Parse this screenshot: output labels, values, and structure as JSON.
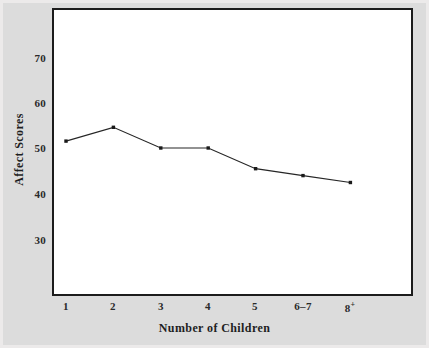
{
  "chart_data": {
    "type": "line",
    "title": "",
    "xlabel": "Number of Children",
    "ylabel": "Affect Scores",
    "categories": [
      "1",
      "2",
      "3",
      "4",
      "5",
      "6–7",
      "8⁺"
    ],
    "values": [
      51.5,
      54.5,
      50,
      50,
      45.5,
      44,
      42.5
    ],
    "series": [
      {
        "name": "Affect Scores",
        "values": [
          51.5,
          54.5,
          50,
          50,
          45.5,
          44,
          42.5
        ]
      }
    ],
    "ylim": [
      24,
      76
    ],
    "yticks": [
      30,
      40,
      50,
      60,
      70
    ],
    "ytick_labels": [
      "30",
      "40",
      "50",
      "60",
      "70"
    ],
    "grid": false,
    "legend": false,
    "marker": "square",
    "line_color": "#262626",
    "marker_color": "#1a1a1a",
    "plot_background": "#ffffff",
    "figure_background": "#dcdcdc",
    "frame_color": "#1c1c1c"
  },
  "axes": {
    "y_tick_labels": [
      "70",
      "60",
      "50",
      "40",
      "30"
    ],
    "x_tick_labels": [
      "1",
      "2",
      "3",
      "4",
      "5",
      "6–7",
      "8"
    ],
    "x_last_superscript": "+",
    "y_title": "Affect Scores",
    "x_title": "Number of Children"
  }
}
